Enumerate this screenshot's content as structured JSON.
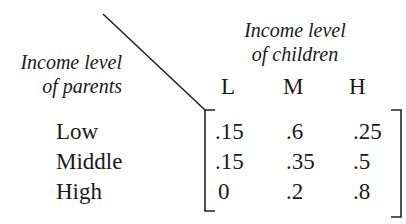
{
  "diagram": {
    "type": "transition_matrix",
    "row_axis_title": [
      "Income level",
      "of parents"
    ],
    "column_axis_title": [
      "Income level",
      "of children"
    ],
    "column_labels": [
      "L",
      "M",
      "H"
    ],
    "row_labels": [
      "Low",
      "Middle",
      "High"
    ],
    "matrix": [
      [
        ".15",
        ".6",
        ".25"
      ],
      [
        ".15",
        ".35",
        ".5"
      ],
      [
        "0",
        ".2",
        ".8"
      ]
    ]
  }
}
